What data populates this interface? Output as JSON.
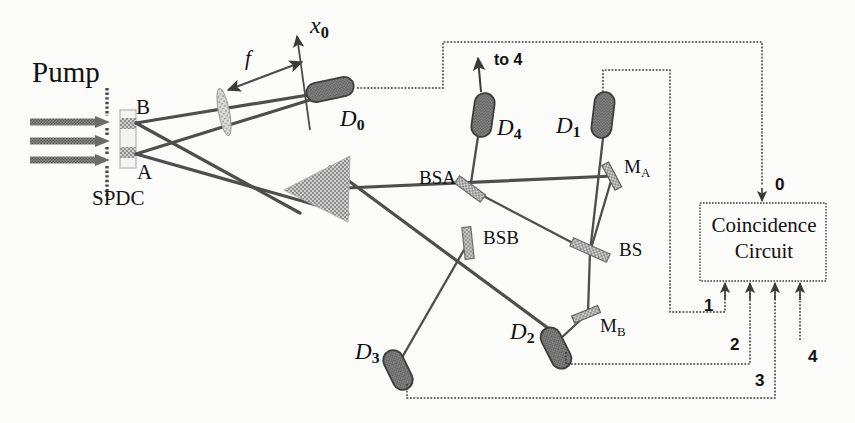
{
  "figure": {
    "kind": "optics-schematic",
    "title_text": "",
    "background_color": "#fbfbfa",
    "ink_color": "#2b2b2b",
    "fill_gray": "#9a9a9a",
    "labels": {
      "pump": "Pump",
      "spdc": "SPDC",
      "region_b": "B",
      "region_a": "A",
      "focal_length": "f",
      "scan_axis": "x",
      "scan_axis_sub": "0",
      "detector0": "D",
      "detector0_sub": "0",
      "detector1": "D",
      "detector1_sub": "1",
      "detector2": "D",
      "detector2_sub": "2",
      "detector3": "D",
      "detector3_sub": "3",
      "detector4": "D",
      "detector4_sub": "4",
      "bsa": "BSA",
      "bsb": "BSB",
      "bs": "BS",
      "mirror_a": "M",
      "mirror_a_sub": "A",
      "mirror_b": "M",
      "mirror_b_sub": "B",
      "to_four": "to 4",
      "coincidence_line1": "Coincidence",
      "coincidence_line2": "Circuit",
      "channel_0": "0",
      "channel_1": "1",
      "channel_2": "2",
      "channel_3": "3",
      "channel_4": "4"
    },
    "components": [
      {
        "name": "pump-beam-arrows",
        "count": 3,
        "label": "Pump"
      },
      {
        "name": "slit-screen",
        "label": ""
      },
      {
        "name": "spdc-crystal",
        "label": "SPDC",
        "regions": [
          "A",
          "B"
        ]
      },
      {
        "name": "lens",
        "label": "f"
      },
      {
        "name": "detector-d0",
        "label": "D0",
        "channel": "0"
      },
      {
        "name": "prism",
        "label": ""
      },
      {
        "name": "beamsplitter-bsa",
        "label": "BSA"
      },
      {
        "name": "beamsplitter-bsb",
        "label": "BSB"
      },
      {
        "name": "beamsplitter-bs",
        "label": "BS"
      },
      {
        "name": "mirror-ma",
        "label": "MA"
      },
      {
        "name": "mirror-mb",
        "label": "MB"
      },
      {
        "name": "detector-d1",
        "label": "D1",
        "channel": "1"
      },
      {
        "name": "detector-d2",
        "label": "D2",
        "channel": "2"
      },
      {
        "name": "detector-d3",
        "label": "D3",
        "channel": "3"
      },
      {
        "name": "detector-d4",
        "label": "D4",
        "channel": "4"
      },
      {
        "name": "coincidence-circuit",
        "label": "Coincidence Circuit",
        "inputs": [
          "0",
          "1",
          "2",
          "3",
          "4"
        ]
      }
    ]
  }
}
